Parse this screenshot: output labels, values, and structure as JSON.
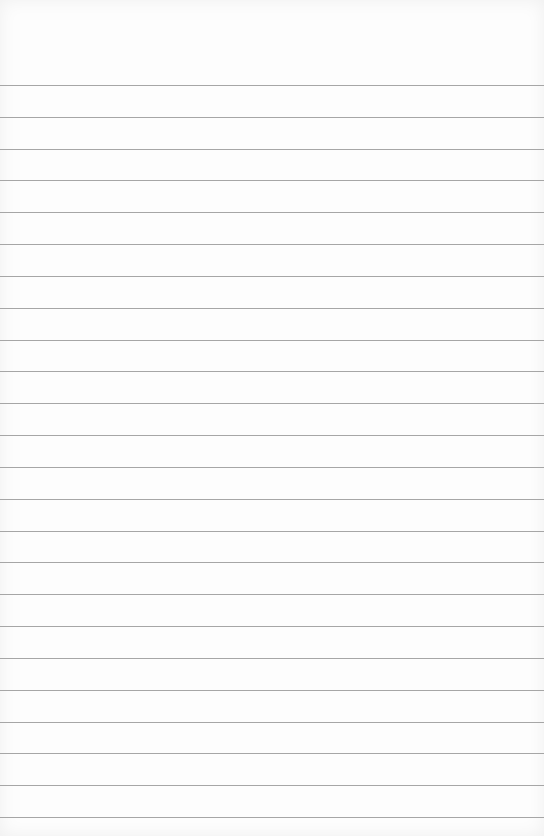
{
  "paper": {
    "background": "#fdfdfd",
    "line_color": "#a6a6a6",
    "first_line_y": 85,
    "line_spacing": 31.83,
    "line_count": 24
  }
}
